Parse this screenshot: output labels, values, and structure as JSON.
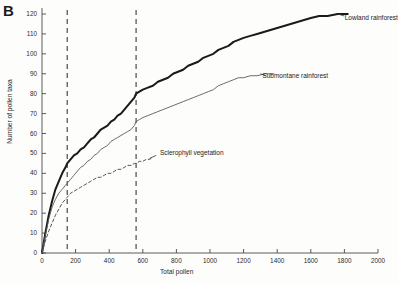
{
  "panel": {
    "label": "B"
  },
  "chart_data": {
    "type": "line",
    "title": "",
    "xlabel": "Total pollen",
    "ylabel": "Number of pollen taxa",
    "xlim": [
      0,
      2000
    ],
    "ylim": [
      0,
      120
    ],
    "xticks": [
      0,
      200,
      400,
      600,
      800,
      1000,
      1200,
      1400,
      1600,
      1800,
      2000
    ],
    "yticks": [
      0,
      10,
      20,
      30,
      40,
      50,
      60,
      70,
      80,
      90,
      100,
      110,
      120
    ],
    "grid": false,
    "legend_position": "inline-annotation",
    "annotations": [
      {
        "text": "Lowland rainforest",
        "x": 1790,
        "y": 118
      },
      {
        "text": "Submontane rainforest",
        "x": 1300,
        "y": 89
      },
      {
        "text": "Sclerophyll vegetation",
        "x": 690,
        "y": 50
      }
    ],
    "reference_lines": [
      {
        "orientation": "vertical",
        "x": 150,
        "style": "dashed"
      },
      {
        "orientation": "vertical",
        "x": 560,
        "style": "dashed"
      }
    ],
    "series": [
      {
        "name": "Lowland rainforest",
        "style": "solid-thick",
        "color": "#1a1a1a",
        "points": [
          [
            0,
            0
          ],
          [
            20,
            10
          ],
          [
            40,
            19
          ],
          [
            60,
            26
          ],
          [
            80,
            32
          ],
          [
            100,
            36
          ],
          [
            120,
            40
          ],
          [
            140,
            43
          ],
          [
            150,
            45
          ],
          [
            170,
            47
          ],
          [
            190,
            49
          ],
          [
            210,
            50
          ],
          [
            230,
            52
          ],
          [
            250,
            53
          ],
          [
            270,
            55
          ],
          [
            290,
            57
          ],
          [
            310,
            58
          ],
          [
            330,
            60
          ],
          [
            350,
            62
          ],
          [
            370,
            63
          ],
          [
            390,
            64
          ],
          [
            410,
            66
          ],
          [
            430,
            67
          ],
          [
            450,
            69
          ],
          [
            470,
            70
          ],
          [
            490,
            72
          ],
          [
            510,
            74
          ],
          [
            530,
            76
          ],
          [
            550,
            78
          ],
          [
            560,
            80
          ],
          [
            580,
            81
          ],
          [
            600,
            82
          ],
          [
            630,
            83
          ],
          [
            660,
            84
          ],
          [
            690,
            86
          ],
          [
            720,
            87
          ],
          [
            750,
            88
          ],
          [
            780,
            90
          ],
          [
            810,
            91
          ],
          [
            840,
            92
          ],
          [
            870,
            94
          ],
          [
            900,
            95
          ],
          [
            930,
            96
          ],
          [
            960,
            98
          ],
          [
            990,
            99
          ],
          [
            1020,
            100
          ],
          [
            1050,
            102
          ],
          [
            1080,
            103
          ],
          [
            1110,
            104
          ],
          [
            1140,
            106
          ],
          [
            1170,
            107
          ],
          [
            1200,
            108
          ],
          [
            1240,
            109
          ],
          [
            1280,
            110
          ],
          [
            1320,
            111
          ],
          [
            1360,
            112
          ],
          [
            1400,
            113
          ],
          [
            1440,
            114
          ],
          [
            1480,
            115
          ],
          [
            1520,
            116
          ],
          [
            1560,
            117
          ],
          [
            1600,
            118
          ],
          [
            1650,
            119
          ],
          [
            1700,
            119
          ],
          [
            1760,
            120
          ],
          [
            1820,
            120
          ]
        ]
      },
      {
        "name": "Submontane rainforest",
        "style": "solid-thin",
        "color": "#5a5a5a",
        "points": [
          [
            0,
            0
          ],
          [
            20,
            9
          ],
          [
            40,
            17
          ],
          [
            60,
            23
          ],
          [
            80,
            27
          ],
          [
            100,
            30
          ],
          [
            120,
            32
          ],
          [
            140,
            34
          ],
          [
            150,
            35
          ],
          [
            170,
            37
          ],
          [
            190,
            39
          ],
          [
            210,
            41
          ],
          [
            230,
            43
          ],
          [
            250,
            44
          ],
          [
            270,
            46
          ],
          [
            290,
            47
          ],
          [
            310,
            49
          ],
          [
            330,
            50
          ],
          [
            350,
            52
          ],
          [
            370,
            53
          ],
          [
            390,
            54
          ],
          [
            410,
            56
          ],
          [
            430,
            57
          ],
          [
            450,
            58
          ],
          [
            470,
            59
          ],
          [
            490,
            60
          ],
          [
            510,
            61
          ],
          [
            530,
            62
          ],
          [
            550,
            64
          ],
          [
            560,
            66
          ],
          [
            580,
            67
          ],
          [
            600,
            68
          ],
          [
            630,
            69
          ],
          [
            660,
            70
          ],
          [
            690,
            71
          ],
          [
            720,
            72
          ],
          [
            750,
            73
          ],
          [
            780,
            74
          ],
          [
            810,
            75
          ],
          [
            840,
            76
          ],
          [
            870,
            77
          ],
          [
            900,
            78
          ],
          [
            930,
            79
          ],
          [
            960,
            80
          ],
          [
            990,
            81
          ],
          [
            1020,
            82
          ],
          [
            1050,
            84
          ],
          [
            1080,
            85
          ],
          [
            1110,
            86
          ],
          [
            1140,
            87
          ],
          [
            1170,
            88
          ],
          [
            1200,
            88
          ],
          [
            1240,
            89
          ],
          [
            1280,
            89
          ],
          [
            1330,
            90
          ],
          [
            1380,
            90
          ]
        ]
      },
      {
        "name": "Sclerophyll vegetation",
        "style": "dashed",
        "color": "#555555",
        "points": [
          [
            0,
            0
          ],
          [
            20,
            6
          ],
          [
            40,
            11
          ],
          [
            60,
            15
          ],
          [
            80,
            19
          ],
          [
            100,
            22
          ],
          [
            120,
            25
          ],
          [
            140,
            27
          ],
          [
            150,
            28
          ],
          [
            170,
            30
          ],
          [
            190,
            31
          ],
          [
            210,
            32
          ],
          [
            230,
            33
          ],
          [
            250,
            34
          ],
          [
            270,
            35
          ],
          [
            290,
            36
          ],
          [
            310,
            37
          ],
          [
            330,
            38
          ],
          [
            350,
            38
          ],
          [
            370,
            39
          ],
          [
            390,
            40
          ],
          [
            410,
            40
          ],
          [
            430,
            41
          ],
          [
            450,
            42
          ],
          [
            470,
            42
          ],
          [
            490,
            43
          ],
          [
            510,
            44
          ],
          [
            530,
            44
          ],
          [
            550,
            45
          ],
          [
            560,
            45
          ],
          [
            580,
            46
          ],
          [
            600,
            46
          ],
          [
            620,
            47
          ],
          [
            640,
            47
          ],
          [
            660,
            48
          ]
        ]
      }
    ]
  }
}
